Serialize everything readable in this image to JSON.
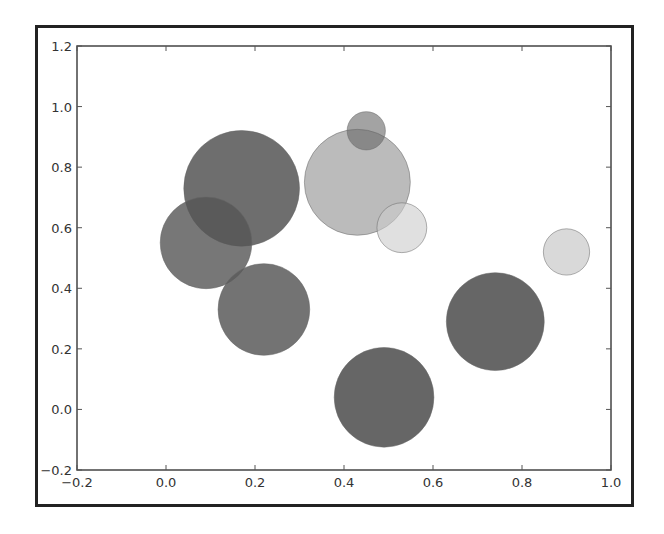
{
  "chart_data": {
    "type": "scatter",
    "title": "",
    "xlabel": "",
    "ylabel": "",
    "xlim": [
      -0.2,
      1.0
    ],
    "ylim": [
      -0.2,
      1.2
    ],
    "grid": false,
    "legend": null,
    "x_ticks": [
      "−0.2",
      "0.0",
      "0.2",
      "0.4",
      "0.6",
      "0.8",
      "1.0"
    ],
    "y_ticks": [
      "−0.2",
      "0.0",
      "0.2",
      "0.4",
      "0.6",
      "0.8",
      "1.0",
      "1.2"
    ],
    "points": [
      {
        "x": 0.17,
        "y": 0.73,
        "r": 0.13,
        "color": "#555555",
        "alpha": 0.85
      },
      {
        "x": 0.09,
        "y": 0.55,
        "r": 0.103,
        "color": "#555555",
        "alpha": 0.8
      },
      {
        "x": 0.22,
        "y": 0.33,
        "r": 0.103,
        "color": "#5a5a5a",
        "alpha": 0.85
      },
      {
        "x": 0.43,
        "y": 0.75,
        "r": 0.119,
        "color": "#aaaaaa",
        "alpha": 0.8
      },
      {
        "x": 0.45,
        "y": 0.92,
        "r": 0.043,
        "color": "#666666",
        "alpha": 0.6
      },
      {
        "x": 0.53,
        "y": 0.6,
        "r": 0.056,
        "color": "#cccccc",
        "alpha": 0.6
      },
      {
        "x": 0.9,
        "y": 0.52,
        "r": 0.052,
        "color": "#d0d0d0",
        "alpha": 0.8
      },
      {
        "x": 0.74,
        "y": 0.29,
        "r": 0.11,
        "color": "#555555",
        "alpha": 0.9
      },
      {
        "x": 0.49,
        "y": 0.04,
        "r": 0.112,
        "color": "#555555",
        "alpha": 0.9
      }
    ]
  }
}
